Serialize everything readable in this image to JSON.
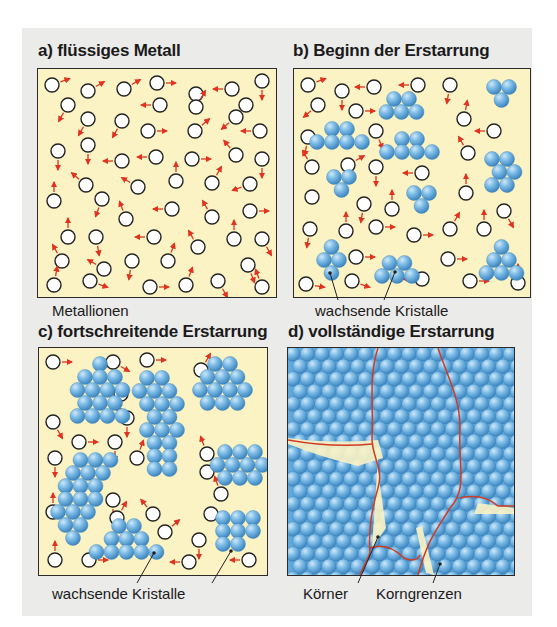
{
  "figure": {
    "colors": {
      "background": "#ebebea",
      "melt": "#fbf3c4",
      "ion_fill": "#ffffff",
      "ion_stroke": "#222222",
      "arrow": "#e0321e",
      "crystal": "#5fa9dc",
      "crystal_highlight": "#cfe8f8",
      "grain_boundary": "#d23a22"
    },
    "panels": [
      {
        "id": "a",
        "title": "a) flüssiges Metall",
        "labels": [
          "Metallionen"
        ]
      },
      {
        "id": "b",
        "title": "b) Beginn der Erstarrung",
        "labels": [
          "Kristallisationskeime"
        ]
      },
      {
        "id": "c",
        "title": "c) fortschreitende Erstarrung",
        "labels": [
          "wachsende Kristalle"
        ]
      },
      {
        "id": "d",
        "title": "d) vollständige Erstarrung",
        "labels": [
          "Körner",
          "Korngrenzen"
        ]
      }
    ]
  }
}
